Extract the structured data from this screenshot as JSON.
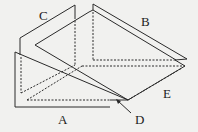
{
  "diagram": {
    "type": "3D folded-panel line drawing",
    "labels": {
      "A": "A",
      "B": "B",
      "C": "C",
      "D": "D",
      "E": "E"
    },
    "colors": {
      "line": "#2a2a2a",
      "background": "#f1f1ef"
    }
  }
}
